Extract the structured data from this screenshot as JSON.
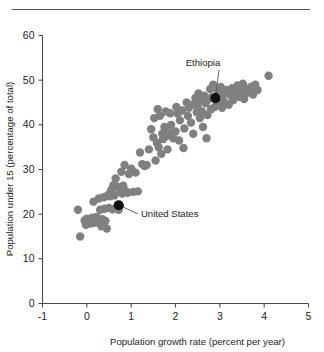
{
  "figure": {
    "top_rule": true,
    "background_color": "#ffffff"
  },
  "chart_data": {
    "type": "scatter",
    "title": "",
    "xlabel": "Population growth rate (percent per year)",
    "ylabel": "Population under 15 (percentage of total)",
    "xlim": [
      -1,
      5
    ],
    "ylim": [
      0,
      60
    ],
    "xticks": [
      -1,
      0,
      1,
      2,
      3,
      4,
      5
    ],
    "xticklabels": [
      "-1",
      "0",
      "1",
      "2",
      "3",
      "4",
      "5"
    ],
    "yticks": [
      0,
      10,
      20,
      30,
      40,
      50,
      60
    ],
    "yticklabels": [
      "0",
      "10",
      "20",
      "30",
      "40",
      "50",
      "60"
    ],
    "grid": false,
    "legend": null,
    "marker_color": "#808080",
    "highlight_color": "#111111",
    "marker_radius": 4.2,
    "points": [
      [
        -0.2,
        21.0
      ],
      [
        -0.15,
        15.0
      ],
      [
        -0.05,
        18.6
      ],
      [
        -0.02,
        17.6
      ],
      [
        0.0,
        19.0
      ],
      [
        0.02,
        18.2
      ],
      [
        0.05,
        18.8
      ],
      [
        0.07,
        17.9
      ],
      [
        0.1,
        18.4
      ],
      [
        0.12,
        19.2
      ],
      [
        0.15,
        18.0
      ],
      [
        0.15,
        22.8
      ],
      [
        0.18,
        18.7
      ],
      [
        0.2,
        18.3
      ],
      [
        0.22,
        19.4
      ],
      [
        0.25,
        18.1
      ],
      [
        0.27,
        23.5
      ],
      [
        0.3,
        18.6
      ],
      [
        0.3,
        21.0
      ],
      [
        0.33,
        17.3
      ],
      [
        0.35,
        18.9
      ],
      [
        0.38,
        23.8
      ],
      [
        0.4,
        21.2
      ],
      [
        0.42,
        18.5
      ],
      [
        0.45,
        16.8
      ],
      [
        0.48,
        24.3
      ],
      [
        0.5,
        21.4
      ],
      [
        0.52,
        24.0
      ],
      [
        0.55,
        25.4
      ],
      [
        0.58,
        21.1
      ],
      [
        0.6,
        26.5
      ],
      [
        0.62,
        24.2
      ],
      [
        0.65,
        28.0
      ],
      [
        0.68,
        26.2
      ],
      [
        0.7,
        22.0
      ],
      [
        0.72,
        21.0
      ],
      [
        0.75,
        25.0
      ],
      [
        0.78,
        29.5
      ],
      [
        0.8,
        24.6
      ],
      [
        0.82,
        26.4
      ],
      [
        0.85,
        31.0
      ],
      [
        0.88,
        25.2
      ],
      [
        0.92,
        24.8
      ],
      [
        0.95,
        29.0
      ],
      [
        1.0,
        30.2
      ],
      [
        1.05,
        25.0
      ],
      [
        1.1,
        29.3
      ],
      [
        1.15,
        25.1
      ],
      [
        1.2,
        33.8
      ],
      [
        1.25,
        31.2
      ],
      [
        1.3,
        30.8
      ],
      [
        1.35,
        31.0
      ],
      [
        1.4,
        34.5
      ],
      [
        1.45,
        39.0
      ],
      [
        1.5,
        37.2
      ],
      [
        1.52,
        41.5
      ],
      [
        1.55,
        32.0
      ],
      [
        1.58,
        36.0
      ],
      [
        1.6,
        43.5
      ],
      [
        1.62,
        35.0
      ],
      [
        1.65,
        42.0
      ],
      [
        1.68,
        33.5
      ],
      [
        1.7,
        38.0
      ],
      [
        1.72,
        36.8
      ],
      [
        1.75,
        39.5
      ],
      [
        1.78,
        43.0
      ],
      [
        1.8,
        37.5
      ],
      [
        1.82,
        34.5
      ],
      [
        1.85,
        38.3
      ],
      [
        1.88,
        42.6
      ],
      [
        1.9,
        40.0
      ],
      [
        1.95,
        37.0
      ],
      [
        2.0,
        38.5
      ],
      [
        2.02,
        44.0
      ],
      [
        2.05,
        42.5
      ],
      [
        2.08,
        36.5
      ],
      [
        2.1,
        41.0
      ],
      [
        2.15,
        43.2
      ],
      [
        2.18,
        34.8
      ],
      [
        2.2,
        39.2
      ],
      [
        2.25,
        45.0
      ],
      [
        2.28,
        42.0
      ],
      [
        2.3,
        43.8
      ],
      [
        2.35,
        40.5
      ],
      [
        2.38,
        44.5
      ],
      [
        2.4,
        38.0
      ],
      [
        2.45,
        46.0
      ],
      [
        2.48,
        42.8
      ],
      [
        2.5,
        44.2
      ],
      [
        2.52,
        47.0
      ],
      [
        2.55,
        41.5
      ],
      [
        2.58,
        45.5
      ],
      [
        2.6,
        43.0
      ],
      [
        2.62,
        39.5
      ],
      [
        2.65,
        46.5
      ],
      [
        2.68,
        44.8
      ],
      [
        2.7,
        37.0
      ],
      [
        2.72,
        42.2
      ],
      [
        2.75,
        45.8
      ],
      [
        2.78,
        48.0
      ],
      [
        2.8,
        43.5
      ],
      [
        2.82,
        46.2
      ],
      [
        2.85,
        49.0
      ],
      [
        2.88,
        44.0
      ],
      [
        2.9,
        46.0
      ],
      [
        2.95,
        47.5
      ],
      [
        3.0,
        45.0
      ],
      [
        3.02,
        48.5
      ],
      [
        3.05,
        43.8
      ],
      [
        3.08,
        46.8
      ],
      [
        3.1,
        45.2
      ],
      [
        3.15,
        47.8
      ],
      [
        3.2,
        44.5
      ],
      [
        3.25,
        46.5
      ],
      [
        3.28,
        48.2
      ],
      [
        3.3,
        45.5
      ],
      [
        3.35,
        47.0
      ],
      [
        3.4,
        48.8
      ],
      [
        3.45,
        46.2
      ],
      [
        3.5,
        47.5
      ],
      [
        3.52,
        49.2
      ],
      [
        3.55,
        45.8
      ],
      [
        3.6,
        48.0
      ],
      [
        3.65,
        47.2
      ],
      [
        3.7,
        48.5
      ],
      [
        3.75,
        46.8
      ],
      [
        3.8,
        49.0
      ],
      [
        3.85,
        47.8
      ],
      [
        4.1,
        51.0
      ]
    ],
    "annotations": [
      {
        "label": "Ethiopia",
        "x": 2.9,
        "y": 46.0,
        "label_x": 2.62,
        "label_y": 53.2,
        "leader": true
      },
      {
        "label": "United  States",
        "x": 0.72,
        "y": 22.0,
        "label_x": 1.22,
        "label_y": 19.4,
        "leader": true
      }
    ]
  }
}
